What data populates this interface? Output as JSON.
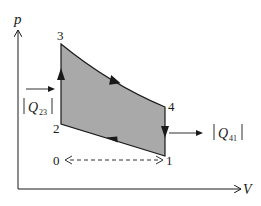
{
  "diagram": {
    "axes": {
      "y_label": "p",
      "x_label": "V"
    },
    "points": [
      {
        "id": "3",
        "label": "3"
      },
      {
        "id": "2",
        "label": "2"
      },
      {
        "id": "4",
        "label": "4"
      },
      {
        "id": "1",
        "label": "1"
      },
      {
        "id": "0",
        "label": "0"
      }
    ],
    "heat_in": {
      "label": "Q",
      "subscript": "23"
    },
    "heat_out": {
      "label": "Q",
      "subscript": "41"
    },
    "colors": {
      "fill": "#a9a9a9",
      "stroke": "#1a1a1a",
      "background": "#ffffff"
    }
  }
}
